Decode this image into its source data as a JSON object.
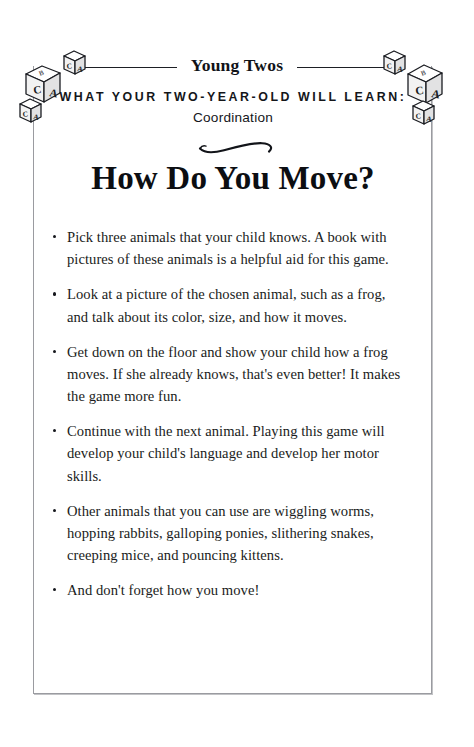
{
  "page": {
    "running_head": "Young Twos",
    "eyebrow": "WHAT YOUR TWO-YEAR-OLD WILL LEARN:",
    "subject": "Coordination",
    "title": "How Do You Move?",
    "ornament_name": "swash-ornament",
    "ink_color": "#14161a",
    "frame_color": "#9a9ba0"
  },
  "decorations": {
    "left_blocks_name": "alphabet-blocks-left",
    "right_blocks_name": "alphabet-blocks-right",
    "block_letters": [
      "A",
      "B",
      "C"
    ]
  },
  "activity": {
    "bullets": [
      "Pick three animals that your child knows. A book with pictures of these animals is a helpful aid for this game.",
      "Look at a picture of the chosen animal, such as a frog, and talk about its color, size, and how it moves.",
      "Get down on the floor and show your child how a frog moves. If she already knows, that's even better! It makes the game more fun.",
      "Continue with the next animal. Playing this game will develop your child's language and develop her motor skills.",
      "Other animals that you can use are wiggling worms, hopping rabbits, galloping ponies, slithering snakes, creeping mice, and pouncing kittens.",
      "And don't forget how you move!"
    ]
  }
}
